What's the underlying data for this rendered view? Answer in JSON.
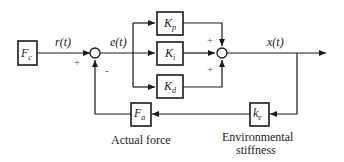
{
  "diagram": {
    "type": "block-diagram",
    "blocks": {
      "fc": {
        "main": "F",
        "sub": "c"
      },
      "kp": {
        "main": "K",
        "sub": "p"
      },
      "ki": {
        "main": "K",
        "sub": "i"
      },
      "kd": {
        "main": "K",
        "sub": "d"
      },
      "ke": {
        "main": "k",
        "sub": "e"
      },
      "fa": {
        "main": "F",
        "sub": "a"
      }
    },
    "signals": {
      "r": "r(t)",
      "e": "e(t)",
      "x": "x(t)"
    },
    "signs": {
      "sum1_plus": "+",
      "sum1_minus": "-",
      "sum2_top": "+",
      "sum2_bottom": "+"
    },
    "captions": {
      "actual_force": "Actual force",
      "env_line1": "Environmental",
      "env_line2": "stiffness"
    },
    "colors": {
      "line": "#1a1a1a",
      "background": "#ffffff"
    }
  }
}
